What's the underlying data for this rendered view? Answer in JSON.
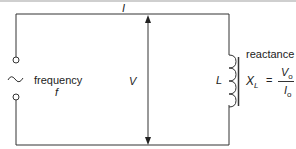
{
  "diagram": {
    "current_label": "I",
    "voltage_label": "V",
    "inductor_label": "L",
    "source_label": "frequency",
    "source_symbol": "f",
    "reactance_title": "reactance",
    "formula": {
      "lhs": "X",
      "lhs_sub": "L",
      "equals": "=",
      "numerator": "V",
      "numerator_sub": "o",
      "denominator": "I",
      "denominator_sub": "o"
    }
  }
}
